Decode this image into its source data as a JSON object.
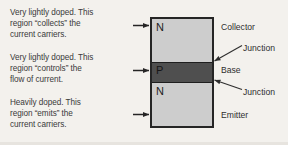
{
  "figure": {
    "background_color": "#f3f1ed",
    "outline_color": "#252525",
    "n_region_color": "#cdcdcd",
    "p_region_color": "#4f4f4f"
  },
  "descriptions": {
    "collector": "Very lightly doped. This\nregion “collects” the\ncurrent carriers.",
    "base": "Very lightly doped. This\nregion “controls” the\nflow of current.",
    "emitter": "Heavily doped. This\nregion “emits” the\ncurrent carriers."
  },
  "regions": [
    {
      "letter": "N",
      "name": "Collector",
      "doping": "light"
    },
    {
      "letter": "P",
      "name": "Base",
      "doping": "light"
    },
    {
      "letter": "N",
      "name": "Emitter",
      "doping": "heavy"
    }
  ],
  "labels": {
    "collector": "Collector",
    "base": "Base",
    "emitter": "Emitter",
    "junction_top": "Junction",
    "junction_bottom": "Junction"
  },
  "icons": {
    "pointer_collector": "arrow-right-icon",
    "pointer_base": "arrow-right-icon",
    "pointer_emitter": "arrow-right-icon",
    "leader_junction_top": "leader-line-arrow-icon",
    "leader_junction_bottom": "leader-line-arrow-icon"
  }
}
